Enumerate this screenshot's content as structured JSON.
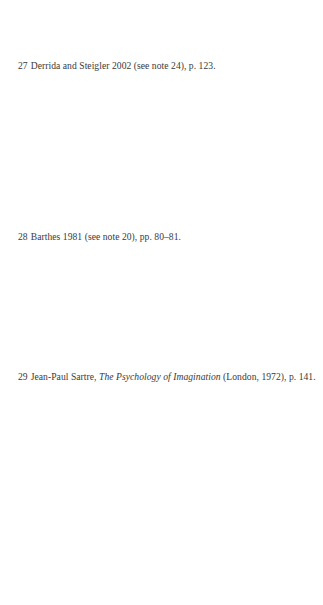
{
  "footnotes": [
    {
      "number": "27",
      "text": "Derrida and Steigler 2002 (see note 24), p. 123."
    },
    {
      "number": "28",
      "text": "Barthes 1981 (see note 20), pp. 80–81."
    },
    {
      "number": "29",
      "prefix": "Jean-Paul Sartre, ",
      "title": "The Psychology of Imagination",
      "suffix": " (London, 1972), p. 141."
    }
  ]
}
